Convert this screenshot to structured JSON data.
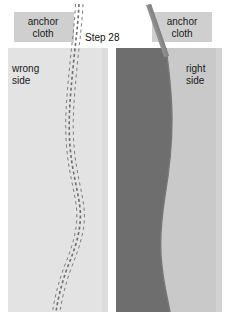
{
  "figure": {
    "title": "Step 28",
    "width": 229,
    "height": 312,
    "background_color": "#ffffff"
  },
  "labels": {
    "step": "Step 28",
    "anchor_cloth_left": "anchor\ncloth",
    "anchor_cloth_right": "anchor\ncloth",
    "wrong_side": "wrong\nside",
    "right_side": "right\nside"
  },
  "panels": {
    "left": {
      "name": "wrong-side-panel",
      "label": "wrong\nside",
      "fabric_color": "#e3e3e3",
      "seam_line_color": "#6e6e6e",
      "seam_stitch_color": "#8a8a8a",
      "x": 8,
      "y": 48,
      "width": 100,
      "height": 264
    },
    "right": {
      "name": "right-side-panel",
      "label": "right\nside",
      "fabric_color": "#c9c9c9",
      "dark_fabric_color": "#6e6e6e",
      "x": 116,
      "y": 48,
      "width": 106,
      "height": 264
    }
  },
  "anchor_tabs": {
    "left": {
      "fill_color": "#cfcfcf",
      "x": 14,
      "y": 12,
      "width": 60,
      "height": 30
    },
    "right": {
      "fill_color": "#cfcfcf",
      "x": 152,
      "y": 12,
      "width": 60,
      "height": 30
    }
  },
  "seam": {
    "type": "curved-dashed-seam",
    "dash_pattern": "3 3",
    "stroke_width": 1.1,
    "color": "#6e6e6e"
  },
  "strip": {
    "name": "anchor-cloth-strip",
    "color": "#8f8f8f",
    "width": 5
  },
  "colors": {
    "fabric_light": "#e3e3e3",
    "fabric_mid": "#c9c9c9",
    "fabric_dark": "#6e6e6e",
    "tab_gray": "#cfcfcf",
    "text": "#1a1a1a"
  }
}
